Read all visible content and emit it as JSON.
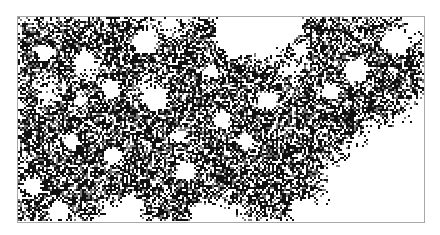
{
  "figure": {
    "type": "percolation-cluster",
    "colors": {
      "background": "#ffffff",
      "frame": "#a8a8a8",
      "cluster_dark": "#111111",
      "cluster_mid": "#7a7a7a"
    },
    "frame": {
      "x": 17,
      "y": 16,
      "width": 406,
      "height": 205
    },
    "density_grid": {
      "cols": 20,
      "rows": 10,
      "cells": [
        "11111110111000111110",
        "11111111111001111111",
        "11101111111110111111",
        "10111101111111111111",
        "11111111111111111110",
        "11111111111111111000",
        "11111111111111110000",
        "11111111111111100000",
        "11111111111111100000",
        "11110011100111000000"
      ]
    },
    "holes": [
      [
        45,
        52,
        8
      ],
      [
        84,
        60,
        10
      ],
      [
        110,
        88,
        9
      ],
      [
        70,
        140,
        8
      ],
      [
        112,
        155,
        9
      ],
      [
        155,
        98,
        12
      ],
      [
        185,
        170,
        10
      ],
      [
        222,
        118,
        9
      ],
      [
        245,
        140,
        8
      ],
      [
        268,
        100,
        9
      ],
      [
        32,
        185,
        9
      ],
      [
        58,
        210,
        10
      ],
      [
        130,
        205,
        11
      ],
      [
        200,
        212,
        10
      ],
      [
        355,
        70,
        12
      ],
      [
        300,
        48,
        7
      ],
      [
        330,
        90,
        8
      ],
      [
        240,
        30,
        26
      ],
      [
        280,
        25,
        20
      ],
      [
        145,
        40,
        12
      ],
      [
        395,
        40,
        14
      ],
      [
        300,
        210,
        12
      ],
      [
        210,
        70,
        7
      ],
      [
        178,
        135,
        7
      ],
      [
        80,
        100,
        6
      ]
    ]
  }
}
